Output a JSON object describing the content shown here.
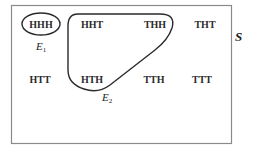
{
  "diagram": {
    "type": "venn-sample-space",
    "sample_space": {
      "label": "S",
      "outcomes": [
        "HHH",
        "HHT",
        "THH",
        "THT",
        "HTT",
        "HTH",
        "TTH",
        "TTT"
      ]
    },
    "events": [
      {
        "name": "E1",
        "label_main": "E",
        "label_sub": "1",
        "members": [
          "HHH"
        ]
      },
      {
        "name": "E2",
        "label_main": "E",
        "label_sub": "2",
        "members": [
          "HHT",
          "THH",
          "HTH"
        ]
      }
    ],
    "colors": {
      "stroke": "#2a2a2a",
      "frame": "#8a8a8a",
      "background": "#ffffff"
    }
  }
}
